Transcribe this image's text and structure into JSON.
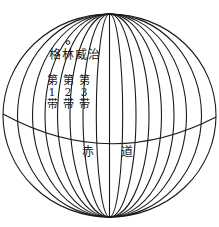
{
  "diagram": {
    "type": "globe-meridians",
    "meridian_count": 17,
    "stroke_color": "#1a1a1a",
    "background": "#ffffff",
    "greenwich_label": "格林威治",
    "zones": [
      {
        "prefix": "第",
        "number": "1",
        "suffix": "带"
      },
      {
        "prefix": "第",
        "number": "2",
        "suffix": "带"
      },
      {
        "prefix": "第",
        "number": "3",
        "suffix": "带"
      }
    ],
    "equator_label": {
      "left": "赤",
      "right": "道"
    }
  }
}
